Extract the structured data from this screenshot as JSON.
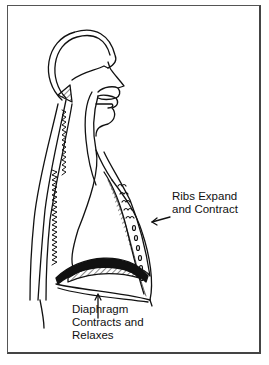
{
  "figure": {
    "labels": {
      "ribs_line1": "Ribs Expand",
      "ribs_line2": "and Contract",
      "diaphragm_line1": "Diaphragm",
      "diaphragm_line2": "Contracts and",
      "diaphragm_line3": "Relaxes"
    }
  }
}
